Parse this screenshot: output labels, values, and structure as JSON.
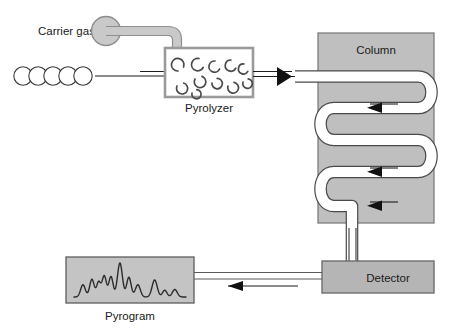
{
  "figure": {
    "width": 464,
    "height": 332,
    "background": "#ffffff"
  },
  "labels": {
    "carrier_gas": "Carrier gas",
    "pyrolyzer": "Pyrolyzer",
    "column": "Column",
    "detector": "Detector",
    "pyrogram": "Pyrogram"
  },
  "colors": {
    "box_fill": "#bfbfbf",
    "box_stroke": "#6e6e6e",
    "tube_fill": "#c9c9c9",
    "tube_stroke": "#8f8f8f",
    "line": "#2b2b2b",
    "outline": "#5a5a5a",
    "white": "#ffffff",
    "text": "#1a1a1a",
    "pyrogram_fill": "#c4c4c4",
    "trace": "#2b2b2b"
  },
  "components": {
    "carrier_gas_sphere": {
      "cx": 106,
      "cy": 31,
      "r": 14
    },
    "sample_chain": {
      "count": 5,
      "cx_start": 23,
      "cy": 76,
      "r": 9,
      "spacing": 15
    },
    "pyrolyzer_box": {
      "x": 165,
      "y": 48,
      "w": 88,
      "h": 49
    },
    "column_box": {
      "x": 318,
      "y": 33,
      "w": 116,
      "h": 190
    },
    "detector_box": {
      "x": 322,
      "y": 261,
      "w": 112,
      "h": 32
    },
    "pyrogram_box": {
      "x": 66,
      "y": 257,
      "w": 128,
      "h": 46
    }
  },
  "fragments": {
    "description": "pyrolysis fragment arcs inside pyrolyzer",
    "count": 11
  },
  "flows": [
    {
      "name": "sample-inlet",
      "from": "sample-chain",
      "to": "pyrolyzer",
      "direction": "right"
    },
    {
      "name": "pyrolyzer-to-column",
      "from": "pyrolyzer",
      "to": "column",
      "direction": "right"
    },
    {
      "name": "column-serpentine",
      "from": "column-inlet",
      "to": "column-outlet",
      "direction": "down"
    },
    {
      "name": "column-to-detector",
      "from": "column",
      "to": "detector",
      "direction": "down"
    },
    {
      "name": "detector-to-pyrogram",
      "from": "detector",
      "to": "pyrogram",
      "direction": "left"
    }
  ],
  "chart_data": {
    "type": "line",
    "title": "Pyrogram",
    "xlabel": "",
    "ylabel": "",
    "grid": false,
    "legend": false,
    "xlim": [
      0,
      100
    ],
    "ylim": [
      0,
      1
    ],
    "peaks": [
      {
        "center": 8,
        "height": 0.36,
        "width": 2.1
      },
      {
        "center": 16,
        "height": 0.52,
        "width": 2.0
      },
      {
        "center": 22,
        "height": 0.44,
        "width": 1.8
      },
      {
        "center": 27,
        "height": 0.62,
        "width": 1.9
      },
      {
        "center": 33,
        "height": 0.6,
        "width": 1.9
      },
      {
        "center": 41,
        "height": 1.0,
        "width": 2.2
      },
      {
        "center": 49,
        "height": 0.58,
        "width": 2.0
      },
      {
        "center": 57,
        "height": 0.36,
        "width": 2.2
      },
      {
        "center": 72,
        "height": 0.5,
        "width": 2.3
      },
      {
        "center": 81,
        "height": 0.2,
        "width": 2.0
      },
      {
        "center": 90,
        "height": 0.22,
        "width": 2.2
      }
    ]
  }
}
